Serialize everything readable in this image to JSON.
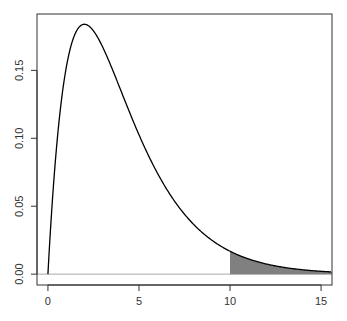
{
  "chart_data": {
    "type": "area",
    "title": "",
    "xlabel": "",
    "ylabel": "",
    "distribution": {
      "name": "chi-square",
      "df": 4
    },
    "xlim": [
      -0.6,
      15.6
    ],
    "ylim": [
      -0.008,
      0.1915
    ],
    "x_ticks": [
      0,
      5,
      10,
      15
    ],
    "x_tick_labels": [
      "0",
      "5",
      "10",
      "15"
    ],
    "y_ticks": [
      0.0,
      0.05,
      0.1,
      0.15
    ],
    "y_tick_labels": [
      "0.00",
      "0.05",
      "0.10",
      "0.15"
    ],
    "grid": false,
    "legend": null,
    "baseline": {
      "y": 0,
      "color": "#aaaaaa"
    },
    "series": [
      {
        "name": "density",
        "x": [
          0,
          0.5,
          1,
          1.5,
          2,
          2.5,
          3,
          3.5,
          4,
          5,
          6,
          7,
          8,
          9,
          10,
          11,
          12,
          13,
          14,
          15,
          15.6
        ],
        "values": [
          0,
          0.0974,
          0.1516,
          0.1771,
          0.1839,
          0.1791,
          0.1673,
          0.152,
          0.1353,
          0.1026,
          0.0747,
          0.0528,
          0.0366,
          0.025,
          0.0168,
          0.0112,
          0.0074,
          0.0049,
          0.0032,
          0.0021,
          0.0016
        ],
        "color": "#000000"
      }
    ],
    "shaded_region": {
      "from_x": 10,
      "to_x": 15.6,
      "color": "#808080",
      "label": "upper tail"
    }
  }
}
